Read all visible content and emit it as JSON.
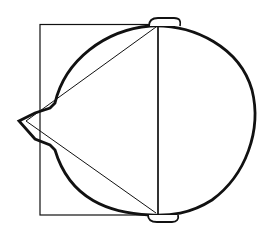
{
  "diagram": {
    "colors": {
      "stroke": "#111111",
      "background": "#ffffff"
    },
    "shapes": {
      "rectangle": {
        "x": 40,
        "y": 24,
        "width": 118,
        "height": 191
      },
      "vertical_line": {
        "x": 158,
        "y1": 25,
        "y2": 215
      },
      "triangle_apex": {
        "x": 24,
        "y": 121
      },
      "beak_tip": {
        "x": 19,
        "y": 121
      },
      "top_cap": {
        "x": 150,
        "y": 18,
        "width": 30,
        "height": 8
      },
      "bottom_cap": {
        "x": 148,
        "y": 214,
        "width": 30,
        "height": 8
      }
    }
  }
}
